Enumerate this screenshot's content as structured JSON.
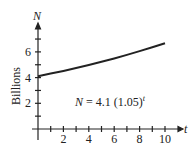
{
  "chart_data": {
    "type": "line",
    "title": "",
    "xlabel": "t",
    "ylabel": "Billions",
    "y_axis_symbol": "N",
    "annotation": {
      "lhs": "N",
      "eq": " = 4.1 (1.05)",
      "exp": "t"
    },
    "x_ticks": [
      2,
      4,
      6,
      8,
      10
    ],
    "y_ticks": [
      2,
      4,
      6
    ],
    "xlim": [
      0,
      10.5
    ],
    "ylim": [
      0,
      7.5
    ],
    "grid": false,
    "series": [
      {
        "name": "N = 4.1(1.05)^t",
        "x": [
          0,
          1,
          2,
          3,
          4,
          5,
          6,
          7,
          8,
          9,
          10
        ],
        "values": [
          4.1,
          4.31,
          4.52,
          4.75,
          4.98,
          5.23,
          5.49,
          5.77,
          6.06,
          6.36,
          6.68
        ]
      }
    ]
  }
}
